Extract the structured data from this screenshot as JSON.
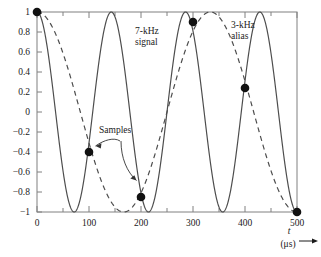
{
  "chart_data": {
    "type": "line",
    "title": "",
    "xlabel": "t",
    "xunit": "(μs)",
    "ylabel": "",
    "xlim": [
      0,
      500
    ],
    "ylim": [
      -1,
      1
    ],
    "grid": false,
    "legend": "inline-annotations",
    "x_ticks": [
      0,
      100,
      200,
      300,
      400,
      500
    ],
    "x_tick_labels": [
      "0",
      "100",
      "200",
      "300",
      "400",
      "500"
    ],
    "x_minor_ticks": [
      50,
      150,
      250,
      350,
      450
    ],
    "y_ticks": [
      1,
      0.8,
      0.6,
      0.4,
      0.2,
      0,
      -0.2,
      -0.4,
      -0.6,
      -0.8,
      -1
    ],
    "y_tick_labels": [
      "1",
      "0.8",
      "0.6",
      "0.4",
      "0.2",
      "0",
      "−0.2",
      "−0.4",
      "−0.6",
      "−0.8",
      "−1"
    ],
    "series": [
      {
        "name": "7-kHz signal",
        "style": "solid",
        "color": "#4d4d4d",
        "frequency_kHz": 7,
        "formula": "cos(2*pi*7000*t)"
      },
      {
        "name": "3-kHz alias",
        "style": "dashed",
        "color": "#4d4d4d",
        "frequency_kHz": 3,
        "formula": "cos(2*pi*3000*t)"
      }
    ],
    "samples": {
      "name": "Samples",
      "color": "#111111",
      "sampling_rate_kHz": 10,
      "x": [
        0,
        100,
        200,
        300,
        400,
        500
      ],
      "y": [
        1,
        -0.4,
        -0.85,
        0.9,
        0.24,
        -1
      ]
    },
    "annotations": [
      {
        "id": "signal-label",
        "text_line1": "7-kHz",
        "text_line2": "signal",
        "x": 135,
        "y": 34
      },
      {
        "id": "alias-label",
        "text_line1": "3-kHz",
        "text_line2": "alias",
        "x": 231,
        "y": 28
      },
      {
        "id": "samples-label",
        "text": "Samples",
        "x": 98,
        "y": 130
      }
    ]
  },
  "axis": {
    "x_title": "t",
    "x_unit": "(μs)"
  },
  "labels": {
    "signal_line1": "7-kHz",
    "signal_line2": "signal",
    "alias_line1": "3-kHz",
    "alias_line2": "alias",
    "samples": "Samples"
  }
}
